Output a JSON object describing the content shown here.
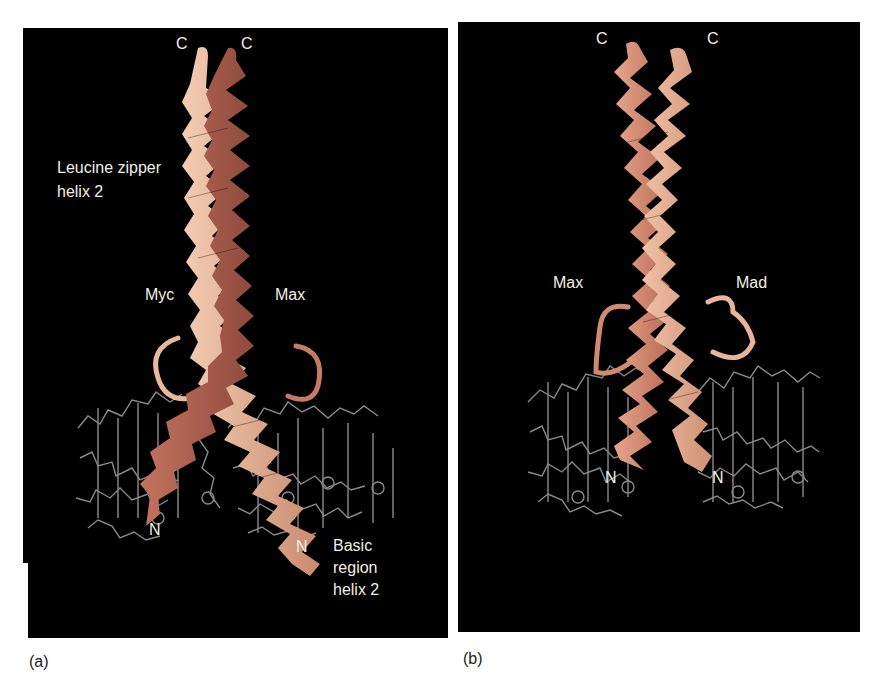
{
  "figure": {
    "panels": [
      {
        "id": "a",
        "caption": "(a)",
        "labels": {
          "c_left": "C",
          "c_right": "C",
          "zipper_line1": "Leucine zipper",
          "zipper_line2": "helix 2",
          "protein_left": "Myc",
          "protein_right": "Max",
          "n_left": "N",
          "n_right": "N",
          "basic_line1": "Basic",
          "basic_line2": "region",
          "basic_line3": "helix 2"
        }
      },
      {
        "id": "b",
        "caption": "(b)",
        "labels": {
          "c_left": "C",
          "c_right": "C",
          "protein_left": "Max",
          "protein_right": "Mad",
          "n_left": "N",
          "n_right": "N"
        }
      }
    ],
    "colors": {
      "background": "#000000",
      "helix_light": "#e9b89a",
      "helix_dark": "#b86a55",
      "dna": "#9a9a9a",
      "label": "#f2efe8"
    }
  }
}
